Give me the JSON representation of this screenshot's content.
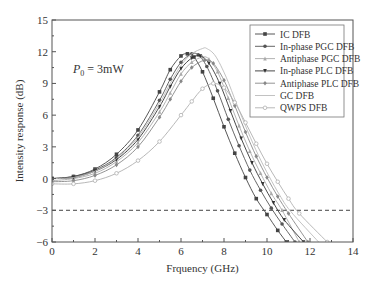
{
  "chart_data": {
    "type": "line",
    "title": "",
    "annotation": "P0 = 3mW",
    "xlabel": "Frquency (GHz)",
    "ylabel": "Intensity response (dB)",
    "xlim": [
      0,
      14
    ],
    "ylim": [
      -6,
      15
    ],
    "xticks": [
      0,
      2,
      4,
      6,
      8,
      10,
      12,
      14
    ],
    "yticks": [
      -6,
      -3,
      0,
      3,
      6,
      9,
      12,
      15
    ],
    "reference_line": {
      "y": -3,
      "style": "dashed"
    },
    "legend_position": "upper right",
    "series": [
      {
        "name": "IC DFB",
        "color": "#444444",
        "marker": "square",
        "x": [
          0,
          1,
          2,
          3,
          4,
          5,
          5.5,
          6,
          6.3,
          6.6,
          7,
          7.5,
          8,
          8.5,
          9,
          9.5,
          10,
          10.5,
          10.9
        ],
        "y": [
          0,
          0.2,
          0.9,
          2.3,
          4.6,
          8.2,
          10.3,
          11.6,
          11.8,
          11.5,
          10.1,
          7.6,
          4.9,
          2.4,
          0.1,
          -1.9,
          -3.4,
          -4.9,
          -6
        ]
      },
      {
        "name": "In-phase PGC DFB",
        "color": "#555555",
        "marker": "circle",
        "x": [
          0,
          1,
          2,
          3,
          4,
          5,
          5.5,
          6,
          6.5,
          6.8,
          7.2,
          7.7,
          8.2,
          8.7,
          9.2,
          9.7,
          10.2,
          10.7,
          11.3
        ],
        "y": [
          0,
          0.2,
          0.8,
          2.0,
          4.1,
          7.4,
          9.4,
          11.0,
          11.8,
          11.7,
          10.6,
          8.3,
          5.6,
          3.1,
          0.8,
          -1.1,
          -2.8,
          -4.3,
          -6
        ]
      },
      {
        "name": "Antiphase PGC DFB",
        "color": "#aaaaaa",
        "marker": "triangle",
        "x": [
          0,
          1,
          2,
          3,
          4,
          5,
          5.5,
          6,
          6.5,
          7,
          7.3,
          7.7,
          8.2,
          8.7,
          9.2,
          9.7,
          10.2,
          10.7,
          11.5
        ],
        "y": [
          -0.2,
          0,
          0.5,
          1.6,
          3.4,
          6.3,
          8.1,
          9.9,
          11.0,
          11.5,
          11.3,
          10.1,
          7.6,
          5.0,
          2.6,
          0.5,
          -1.4,
          -3.0,
          -6
        ]
      },
      {
        "name": "In-phase PLC DFB",
        "color": "#333333",
        "marker": "triangle-down",
        "x": [
          0,
          1,
          2,
          3,
          4,
          5,
          5.5,
          6,
          6.5,
          6.9,
          7.3,
          7.8,
          8.3,
          8.8,
          9.3,
          9.8,
          10.3,
          10.8,
          11.7
        ],
        "y": [
          0,
          0.1,
          0.7,
          1.8,
          3.7,
          6.8,
          8.7,
          10.4,
          11.4,
          11.6,
          10.9,
          9.0,
          6.4,
          3.8,
          1.5,
          -0.5,
          -2.3,
          -3.9,
          -6
        ]
      },
      {
        "name": "Antiphase PLC DFB",
        "color": "#888888",
        "marker": "diamond",
        "x": [
          0,
          1,
          2,
          3,
          4,
          5,
          5.5,
          6,
          6.5,
          7.1,
          7.5,
          8,
          8.5,
          9,
          9.5,
          10,
          10.5,
          11,
          11.9
        ],
        "y": [
          -0.3,
          -0.2,
          0.3,
          1.3,
          3.0,
          5.8,
          7.5,
          9.2,
          10.5,
          11.2,
          10.9,
          9.3,
          6.9,
          4.4,
          2.1,
          0.1,
          -1.7,
          -3.3,
          -6
        ]
      },
      {
        "name": "GC DFB",
        "color": "#bbbbbb",
        "marker": "none",
        "x": [
          0,
          1,
          2,
          3,
          4,
          5,
          5.5,
          6,
          6.5,
          7,
          7.2,
          7.6,
          8.1,
          8.6,
          9.1,
          9.6,
          10.1,
          10.6,
          11.1,
          12.4
        ],
        "y": [
          0,
          0.1,
          0.7,
          1.9,
          3.9,
          7.1,
          9.0,
          10.7,
          11.8,
          12.3,
          12.3,
          11.6,
          9.6,
          7.0,
          4.5,
          2.2,
          0.2,
          -1.6,
          -3.1,
          -6
        ]
      },
      {
        "name": "QWPS DFB",
        "color": "#b0b0b0",
        "marker": "circle-open",
        "x": [
          0,
          1,
          2,
          3,
          4,
          5,
          6,
          6.5,
          7,
          7.5,
          8,
          8.5,
          9,
          9.5,
          10,
          10.5,
          11,
          11.5,
          12.8
        ],
        "y": [
          -0.5,
          -0.5,
          -0.2,
          0.5,
          1.7,
          3.5,
          6.0,
          7.3,
          8.5,
          9.0,
          8.6,
          7.2,
          5.3,
          3.3,
          1.4,
          -0.3,
          -1.9,
          -3.3,
          -6
        ]
      }
    ]
  }
}
